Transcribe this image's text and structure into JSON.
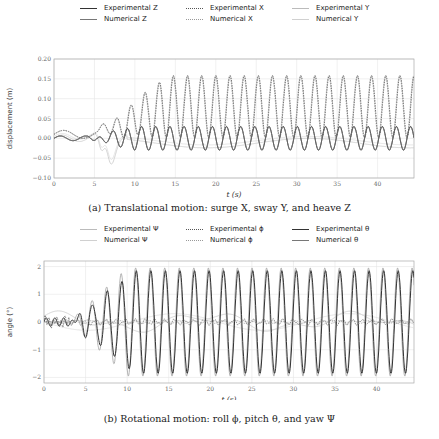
{
  "chart_data": [
    {
      "type": "line",
      "id": "translational",
      "caption": "(a) Translational motion: surge X, sway Y, and heave Z",
      "xlabel": "t (s)",
      "ylabel": "displacement (m)",
      "xlim": [
        0,
        44.5
      ],
      "ylim": [
        -0.1,
        0.2
      ],
      "xticks": [
        0,
        5,
        10,
        15,
        20,
        25,
        30,
        35,
        40
      ],
      "yticks": [
        -0.1,
        -0.05,
        0.0,
        0.05,
        0.1,
        0.15,
        0.2
      ],
      "ytick_labels": [
        "−0.10",
        "−0.05",
        "0.00",
        "0.05",
        "0.10",
        "0.15",
        "0.20"
      ],
      "grid": true,
      "legend_position": "top",
      "legend": [
        {
          "label": "Experimental Z",
          "style": "solid",
          "color": "#333333"
        },
        {
          "label": "Experimental X",
          "style": "dotted",
          "color": "#555555"
        },
        {
          "label": "Experimental Y",
          "style": "solid",
          "color": "#bbbbbb"
        },
        {
          "label": "Numerical Z",
          "style": "solid",
          "color": "#777777"
        },
        {
          "label": "Numerical X",
          "style": "dotted",
          "color": "#999999"
        },
        {
          "label": "Numerical Y",
          "style": "solid",
          "color": "#d0d0d0"
        }
      ],
      "series": [
        {
          "name": "X (surge)",
          "description": "oscillation growing from ~0 to peaks ~0.15-0.16 m after t=12 s, troughs ~0.0 m",
          "period_s": 1.75,
          "steady_mean": 0.075,
          "steady_amplitude": 0.075
        },
        {
          "name": "Z (heave)",
          "description": "oscillation centered at ~0 with amplitude ~0.03 m",
          "period_s": 1.75,
          "steady_mean": 0.0,
          "steady_amplitude": 0.03
        },
        {
          "name": "Y (sway)",
          "description": "transient up to -0.07 m near t=7 s, then slowly drifting near 0 to -0.02 m",
          "steady_mean": -0.01,
          "steady_amplitude": 0.005
        }
      ]
    },
    {
      "type": "line",
      "id": "rotational",
      "caption": "(b) Rotational motion: roll ϕ, pitch θ, and yaw Ψ",
      "xlabel": "t (s)",
      "ylabel": "angle (°)",
      "xlim": [
        0,
        44.5
      ],
      "ylim": [
        -2.2,
        2.2
      ],
      "xticks": [
        0,
        5,
        10,
        15,
        20,
        25,
        30,
        35,
        40
      ],
      "yticks": [
        -2,
        -1,
        0,
        1,
        2
      ],
      "ytick_labels": [
        "−2",
        "−1",
        "0",
        "1",
        "2"
      ],
      "grid": true,
      "legend_position": "top",
      "legend": [
        {
          "label": "Experimental Ψ",
          "style": "solid",
          "color": "#bbbbbb"
        },
        {
          "label": "Experimental ϕ",
          "style": "dotted",
          "color": "#555555"
        },
        {
          "label": "Experimental θ",
          "style": "solid",
          "color": "#333333"
        },
        {
          "label": "Numerical Ψ",
          "style": "solid",
          "color": "#d0d0d0"
        },
        {
          "label": "Numerical ϕ",
          "style": "dotted",
          "color": "#999999"
        },
        {
          "label": "Numerical θ",
          "style": "solid",
          "color": "#777777"
        }
      ],
      "series": [
        {
          "name": "θ (pitch)",
          "description": "oscillation growing to amplitude ~1.8-2.0° after t=10 s",
          "period_s": 1.75,
          "steady_mean": 0.0,
          "steady_amplitude": 1.8
        },
        {
          "name": "ϕ (roll)",
          "description": "small noisy oscillation near 0, amplitude ~0.1°",
          "steady_mean": 0.0,
          "steady_amplitude": 0.1
        },
        {
          "name": "Ψ (yaw)",
          "description": "slow drift between -0.4° and 0.5°",
          "steady_mean": 0.0,
          "steady_amplitude": 0.3
        }
      ]
    }
  ]
}
